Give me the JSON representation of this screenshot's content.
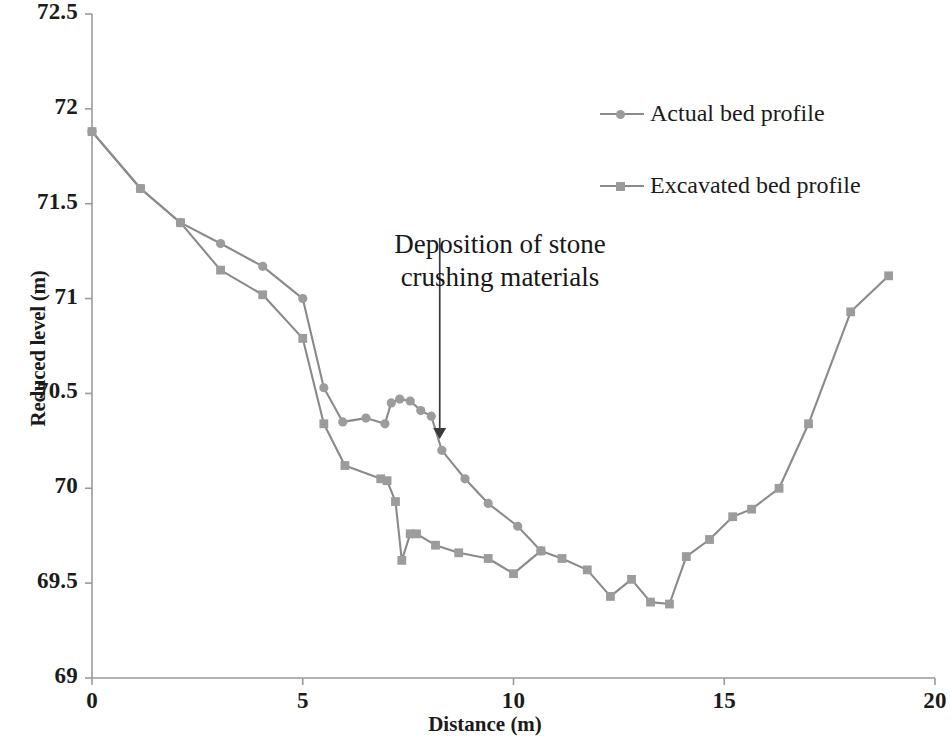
{
  "chart_data": {
    "type": "line",
    "title": "",
    "xlabel": "Distance (m)",
    "ylabel": "Reduced level  (m)",
    "xlim": [
      0,
      20
    ],
    "ylim": [
      69,
      72.5
    ],
    "xticks": [
      0,
      5,
      10,
      15,
      20
    ],
    "yticks": [
      69,
      69.5,
      70,
      70.5,
      71,
      71.5,
      72,
      72.5
    ],
    "xtick_labels": [
      "0",
      "5",
      "10",
      "15",
      "20"
    ],
    "ytick_labels": [
      "69",
      "69.5",
      "70",
      "70.5",
      "71",
      "71.5",
      "72",
      "72.5"
    ],
    "grid": false,
    "legend_position": "upper-right",
    "line_color": "#8a8a8a",
    "marker_color": "#9c9c9c",
    "axis_color": "#9a9a9a",
    "text_color": "#1b1b1b",
    "series": [
      {
        "name": "Actual bed profile",
        "marker": "circle",
        "points": [
          [
            0.0,
            71.88
          ],
          [
            1.15,
            71.58
          ],
          [
            2.1,
            71.4
          ],
          [
            3.05,
            71.29
          ],
          [
            4.05,
            71.17
          ],
          [
            5.0,
            71.0
          ],
          [
            5.5,
            70.53
          ],
          [
            5.95,
            70.35
          ],
          [
            6.5,
            70.37
          ],
          [
            6.95,
            70.34
          ],
          [
            7.1,
            70.45
          ],
          [
            7.3,
            70.47
          ],
          [
            7.55,
            70.46
          ],
          [
            7.8,
            70.41
          ],
          [
            8.05,
            70.38
          ],
          [
            8.3,
            70.2
          ],
          [
            8.85,
            70.05
          ],
          [
            9.4,
            69.92
          ],
          [
            10.1,
            69.8
          ],
          [
            10.65,
            69.67
          ]
        ]
      },
      {
        "name": "Excavated bed profile",
        "marker": "square",
        "points": [
          [
            0.0,
            71.88
          ],
          [
            1.15,
            71.58
          ],
          [
            2.1,
            71.4
          ],
          [
            3.05,
            71.15
          ],
          [
            4.05,
            71.02
          ],
          [
            5.0,
            70.79
          ],
          [
            5.5,
            70.34
          ],
          [
            6.0,
            70.12
          ],
          [
            6.85,
            70.05
          ],
          [
            7.0,
            70.04
          ],
          [
            7.2,
            69.93
          ],
          [
            7.35,
            69.62
          ],
          [
            7.55,
            69.76
          ],
          [
            7.7,
            69.76
          ],
          [
            8.15,
            69.7
          ],
          [
            8.7,
            69.66
          ],
          [
            9.4,
            69.63
          ],
          [
            10.0,
            69.55
          ],
          [
            10.65,
            69.67
          ],
          [
            11.15,
            69.63
          ],
          [
            11.75,
            69.57
          ],
          [
            12.3,
            69.43
          ],
          [
            12.8,
            69.52
          ],
          [
            13.25,
            69.4
          ],
          [
            13.7,
            69.39
          ],
          [
            14.1,
            69.64
          ],
          [
            14.65,
            69.73
          ],
          [
            15.2,
            69.85
          ],
          [
            15.65,
            69.89
          ],
          [
            16.3,
            70.0
          ],
          [
            17.0,
            70.34
          ],
          [
            18.0,
            70.93
          ],
          [
            18.9,
            71.12
          ]
        ]
      }
    ],
    "annotations": [
      {
        "name": "deposition-annotation",
        "text": "Deposition of stone\ncrushing materials",
        "arrow": {
          "x": 8.25,
          "y_from": 71.32,
          "y_to": 70.26
        }
      }
    ]
  },
  "legend": {
    "actual_label": "Actual bed profile",
    "excavated_label": "Excavated bed profile"
  },
  "axes": {
    "x_title": "Distance (m)",
    "y_title": "Reduced level  (m)",
    "x_labels": [
      "0",
      "5",
      "10",
      "15",
      "20"
    ],
    "y_labels": [
      "72.5",
      "72",
      "71.5",
      "71",
      "70.5",
      "70",
      "69.5",
      "69"
    ]
  },
  "annotation": {
    "line1": "Deposition of stone",
    "line2": "crushing materials",
    "full": "Deposition of stone\ncrushing materials"
  }
}
